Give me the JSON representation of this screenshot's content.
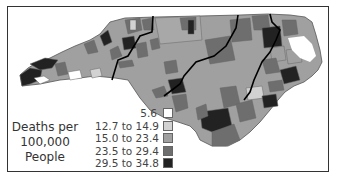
{
  "map": {
    "region": "North Carolina counties",
    "colors": {
      "class1": "#ffffff",
      "class2": "#d2d2d2",
      "class3": "#a0a0a0",
      "class4": "#6e6e6e",
      "class5": "#222222",
      "border": "#555555",
      "region_border": "#000000"
    }
  },
  "legend": {
    "title_lines": [
      "Deaths per",
      "100,000",
      "People"
    ],
    "items": [
      {
        "label": "5.6",
        "color": "#ffffff"
      },
      {
        "label": "12.7 to 14.9",
        "color": "#d2d2d2"
      },
      {
        "label": "15.0 to 23.4",
        "color": "#a0a0a0"
      },
      {
        "label": "23.5 to 29.4",
        "color": "#6e6e6e"
      },
      {
        "label": "29.5 to 34.8",
        "color": "#222222"
      }
    ]
  }
}
